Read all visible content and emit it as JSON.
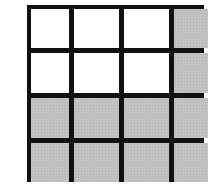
{
  "figure": {
    "type": "grid",
    "rows": 4,
    "columns": 4,
    "colors": {
      "border": "#111111",
      "shaded": "#bcbcbc",
      "unshaded": "#ffffff"
    },
    "cells": [
      [
        "white",
        "white",
        "white",
        "gray"
      ],
      [
        "white",
        "white",
        "white",
        "gray"
      ],
      [
        "gray",
        "gray",
        "gray",
        "gray"
      ],
      [
        "gray",
        "gray",
        "gray",
        "gray"
      ]
    ],
    "shaded_count": 10,
    "unshaded_count": 6,
    "total_count": 16
  }
}
